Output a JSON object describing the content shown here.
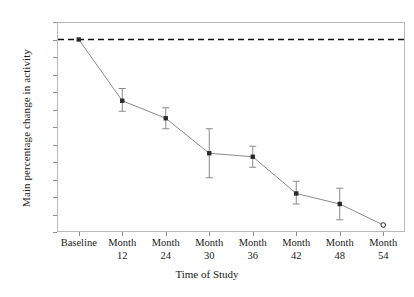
{
  "chart_data": {
    "type": "line",
    "title": "",
    "xlabel": "Time of Study",
    "ylabel": "Main percentage change in activity",
    "categories": [
      "Baseline",
      "Month 12",
      "Month 24",
      "Month 30",
      "Month 36",
      "Month 42",
      "Month 48",
      "Month 54"
    ],
    "category_lines": [
      {
        "l1": "Baseline",
        "l2": ""
      },
      {
        "l1": "Month",
        "l2": "12"
      },
      {
        "l1": "Month",
        "l2": "24"
      },
      {
        "l1": "Month",
        "l2": "30"
      },
      {
        "l1": "Month",
        "l2": "36"
      },
      {
        "l1": "Month",
        "l2": "42"
      },
      {
        "l1": "Month",
        "l2": "48"
      },
      {
        "l1": "Month",
        "l2": "54"
      }
    ],
    "series": [
      {
        "name": "Main percentage change in activity",
        "values": [
          0,
          -17.5,
          -22.5,
          -32.5,
          -33.5,
          -44,
          -47,
          -53
        ],
        "err_low": [
          0,
          -20.5,
          -25.5,
          -39.5,
          -36.5,
          -47,
          -51.5,
          -53
        ],
        "err_high": [
          0,
          -14,
          -19.5,
          -25.5,
          -30.5,
          -40.5,
          -42.5,
          -53
        ]
      }
    ],
    "ylim": [
      -55,
      5
    ],
    "yticks": [
      5,
      0,
      -5,
      -10,
      -15,
      -20,
      -25,
      -30,
      -35,
      -40,
      -45,
      -50,
      -55
    ],
    "ytick_labels": [
      "5",
      "0",
      "−5",
      "−10",
      "−15",
      "−20",
      "−25",
      "−30",
      "−35",
      "−40",
      "−45",
      "−50",
      "−55"
    ],
    "grid": false,
    "legend": "none",
    "reference_line": {
      "value": 0,
      "style": "dashed"
    },
    "marker_style": "filled-square",
    "last_marker_style": "open-circle",
    "colors": {
      "line": "#8a8a8a",
      "marker": "#2b2b2b",
      "errorbar": "#8a8a8a",
      "frame": "#b9b9b9",
      "reference": "#111111",
      "text": "#1a1a1a"
    }
  }
}
